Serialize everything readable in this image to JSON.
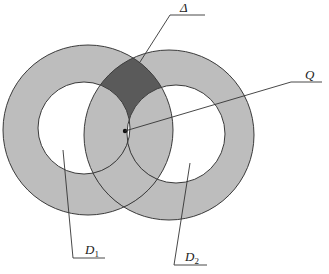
{
  "diagram": {
    "type": "two overlapping annuli",
    "colors": {
      "ring_fill": "#bdbdbd",
      "overlap_dark": "#5a5a5a",
      "stroke": "#3a3a3a",
      "background": "#ffffff"
    },
    "labels": {
      "delta": "Δ",
      "q": "Q",
      "d1_main": "D",
      "d1_sub": "1",
      "d2_main": "D",
      "d2_sub": "2"
    },
    "annuli": [
      {
        "name": "D1",
        "center": [
          88,
          130
        ],
        "outer_r": 85,
        "inner_r": 46
      },
      {
        "name": "D2",
        "center": [
          169,
          135
        ],
        "outer_r": 85,
        "inner_r": 49
      }
    ],
    "point_q": [
      125,
      131
    ]
  }
}
